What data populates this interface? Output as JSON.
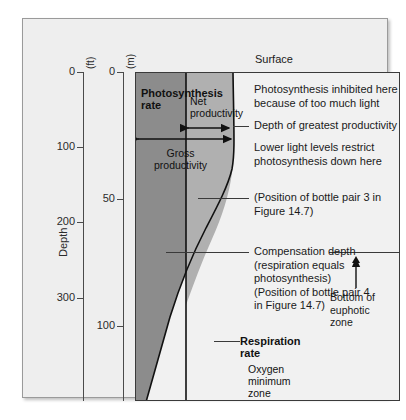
{
  "figure": {
    "surface_label": "Surface",
    "depth_axis_title": "Depth",
    "axes": {
      "feet": {
        "unit": "(ft)",
        "ticks": [
          {
            "label": "0",
            "y": 53
          },
          {
            "label": "100",
            "y": 128
          },
          {
            "label": "200",
            "y": 203
          },
          {
            "label": "300",
            "y": 279
          }
        ]
      },
      "meters": {
        "unit": "(m)",
        "ticks": [
          {
            "label": "0",
            "y": 53
          },
          {
            "label": "50",
            "y": 180
          },
          {
            "label": "100",
            "y": 307
          }
        ]
      }
    },
    "plot_labels": {
      "photosynthesis_rate": "Photosynthesis\nrate",
      "net_productivity": "Net\nproductivity",
      "gross_productivity": "Gross\nproductivity",
      "respiration_rate": "Respiration\nrate",
      "oxygen_minimum_zone": "Oxygen\nminimum\nzone"
    },
    "annotations": {
      "inhibited": "Photosynthesis inhibited here\nbecause of too much light",
      "greatest_productivity": "Depth of greatest productivity",
      "lower_light": "Lower light levels restrict\nphotosynthesis down here",
      "bottle_pair_3": "(Position of bottle pair 3 in\nFigure 14.7)",
      "compensation_depth": "Compensation depth\n(respiration equals\nphotosynthesis)\n(Position of bottle pair 4\nin Figure 14.7)",
      "euphotic_bottom": "Bottom of\neuphotic\nzone"
    },
    "colors": {
      "gross_band": "#8c8c8c",
      "net_band": "#b0b0b0",
      "panel_bg": "#eeeeee",
      "plot_bg": "#f1f1f1",
      "frame": "#3a3a3a"
    }
  },
  "chart_data": {
    "type": "area",
    "xlabel": "Rate",
    "ylabel": "Depth",
    "y_units": [
      "ft",
      "m"
    ],
    "ylim_ft": [
      0,
      400
    ],
    "ylim_m": [
      0,
      130
    ],
    "yticks_ft": [
      0,
      100,
      200,
      300
    ],
    "yticks_m": [
      0,
      50,
      100
    ],
    "grid": false,
    "legend": "none",
    "series": [
      {
        "name": "Respiration rate",
        "description": "Constant rate with depth; vertical line",
        "kind": "vertical-line",
        "value_rate": 0.19
      },
      {
        "name": "Photosynthesis rate",
        "description": "Rises from surface to a maximum near 35 m then decreases to zero with depth",
        "kind": "curve",
        "points": [
          {
            "depth_m": 0,
            "rate": 0.19
          },
          {
            "depth_m": 6,
            "rate": 0.3
          },
          {
            "depth_m": 14,
            "rate": 0.48
          },
          {
            "depth_m": 22,
            "rate": 0.62
          },
          {
            "depth_m": 30,
            "rate": 0.68
          },
          {
            "depth_m": 36,
            "rate": 0.69
          },
          {
            "depth_m": 44,
            "rate": 0.63
          },
          {
            "depth_m": 54,
            "rate": 0.52
          },
          {
            "depth_m": 66,
            "rate": 0.39
          },
          {
            "depth_m": 78,
            "rate": 0.28
          },
          {
            "depth_m": 92,
            "rate": 0.17
          },
          {
            "depth_m": 106,
            "rate": 0.09
          },
          {
            "depth_m": 120,
            "rate": 0.03
          },
          {
            "depth_m": 130,
            "rate": 0.0
          }
        ]
      }
    ],
    "annotated_depths": [
      {
        "name": "Depth of greatest productivity",
        "depth_m": 36
      },
      {
        "name": "Position of bottle pair 3",
        "depth_m": 60
      },
      {
        "name": "Compensation depth / bottle pair 4 / bottom of euphotic zone",
        "depth_m": 70
      }
    ],
    "regions": [
      {
        "name": "Gross productivity",
        "span": "from zero rate to photosynthesis curve"
      },
      {
        "name": "Net productivity",
        "span": "from respiration line to photosynthesis curve"
      },
      {
        "name": "Oxygen minimum zone",
        "depth_range_m": [
          95,
          130
        ]
      }
    ]
  }
}
